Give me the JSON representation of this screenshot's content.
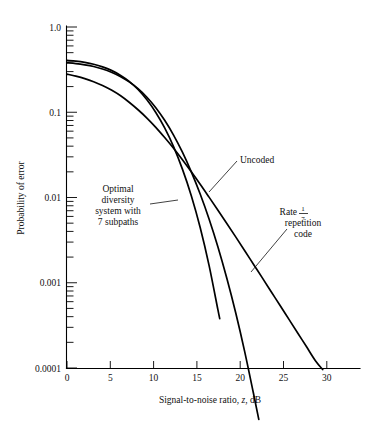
{
  "chart_data": {
    "type": "line",
    "title": "",
    "xlabel": "Signal-to-noise ratio, z, dB",
    "ylabel": "Probability of error",
    "xlabel_parts": {
      "before": "Signal-to-noise ratio, ",
      "italic": "z",
      "after": ", dB"
    },
    "xlim": [
      0,
      33
    ],
    "ylim": [
      0.0001,
      1.0
    ],
    "yscale": "log",
    "xscale": "linear",
    "grid": false,
    "legend": "annotations on curves",
    "xticks": [
      0,
      5,
      10,
      15,
      20,
      25,
      30
    ],
    "xtick_labels": [
      "0",
      "5",
      "10",
      "15",
      "20",
      "25",
      "30"
    ],
    "yticks": [
      1.0,
      0.1,
      0.01,
      0.001,
      0.0001
    ],
    "ytick_labels": [
      "1.0",
      "0.1",
      "0.01",
      "0.001",
      "0.0001"
    ],
    "y_minor_ticks": true,
    "series": [
      {
        "name": "Uncoded",
        "label": "Uncoded",
        "points": [
          [
            0,
            0.28
          ],
          [
            1,
            0.265
          ],
          [
            2,
            0.248
          ],
          [
            3,
            0.228
          ],
          [
            4,
            0.206
          ],
          [
            5,
            0.182
          ],
          [
            6,
            0.157
          ],
          [
            7,
            0.131
          ],
          [
            8,
            0.107
          ],
          [
            9,
            0.0855
          ],
          [
            10,
            0.0665
          ],
          [
            11,
            0.0505
          ],
          [
            12,
            0.0378
          ],
          [
            13,
            0.0277
          ],
          [
            14,
            0.02
          ],
          [
            15,
            0.0143
          ],
          [
            16,
            0.0101
          ],
          [
            17,
            0.0071
          ],
          [
            18,
            0.00496
          ],
          [
            19,
            0.00345
          ],
          [
            20,
            0.00239
          ],
          [
            21,
            0.00165
          ],
          [
            22,
            0.00114
          ],
          [
            23,
            0.000785
          ],
          [
            24,
            0.00054
          ],
          [
            25,
            0.000372
          ],
          [
            26,
            0.000256
          ],
          [
            27,
            0.000176
          ],
          [
            28,
            0.000121
          ],
          [
            28.8,
            9.6e-05
          ]
        ]
      },
      {
        "name": "Rate 1/7 repetition code",
        "label": "Rate 1/7 repetition code",
        "label_parts": {
          "line1_prefix": "Rate ",
          "numerator": "1",
          "denominator": "7",
          "line2": "repetition",
          "line3": "code"
        },
        "points": [
          [
            0,
            0.38
          ],
          [
            1,
            0.372
          ],
          [
            2,
            0.36
          ],
          [
            3,
            0.344
          ],
          [
            4,
            0.322
          ],
          [
            5,
            0.295
          ],
          [
            6,
            0.263
          ],
          [
            7,
            0.227
          ],
          [
            8,
            0.189
          ],
          [
            9,
            0.15
          ],
          [
            10,
            0.113
          ],
          [
            11,
            0.0805
          ],
          [
            12,
            0.054
          ],
          [
            13,
            0.034
          ],
          [
            14,
            0.02
          ],
          [
            15,
            0.011
          ],
          [
            16,
            0.0056
          ],
          [
            17,
            0.00263
          ],
          [
            18,
            0.00113
          ],
          [
            19,
            0.000445
          ],
          [
            20,
            0.000158
          ],
          [
            21,
            5.05e-05
          ],
          [
            21.6,
            2.5e-05
          ]
        ]
      },
      {
        "name": "Optimal diversity system with 7 subpaths",
        "label": "Optimal diversity system with 7 subpaths",
        "label_lines": [
          "Optimal",
          "diversity",
          "system with",
          "7 subpaths"
        ],
        "points": [
          [
            0,
            0.405
          ],
          [
            1,
            0.397
          ],
          [
            2,
            0.384
          ],
          [
            3,
            0.366
          ],
          [
            4,
            0.341
          ],
          [
            5,
            0.31
          ],
          [
            6,
            0.272
          ],
          [
            7,
            0.23
          ],
          [
            8,
            0.185
          ],
          [
            9,
            0.14
          ],
          [
            10,
            0.0995
          ],
          [
            11,
            0.0655
          ],
          [
            12,
            0.0395
          ],
          [
            13,
            0.0215
          ],
          [
            14,
            0.0105
          ],
          [
            15,
            0.00445
          ],
          [
            16,
            0.0016
          ],
          [
            17,
            0.00048
          ],
          [
            17.2,
            0.00038
          ]
        ]
      }
    ],
    "annotations": [
      {
        "id": "uncoded",
        "text": "Uncoded",
        "x_px": 240,
        "y_px": 159,
        "leader_to_x_px": 208,
        "leader_to_y_px": 192
      },
      {
        "id": "rate-rep",
        "text": "Rate 1/7 repetition code",
        "x_px": 300,
        "y_px": 212,
        "leader_to_x_px": 252,
        "leader_to_y_px": 272
      },
      {
        "id": "optimal-div",
        "text": "Optimal diversity system with 7 subpaths",
        "x_px": 118,
        "y_px": 196,
        "leader_to_x_px": 177,
        "leader_to_y_px": 202
      }
    ]
  }
}
